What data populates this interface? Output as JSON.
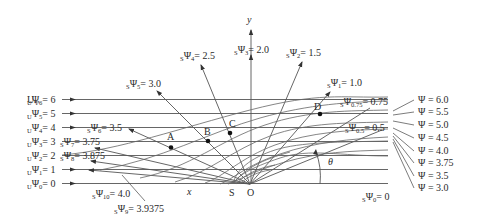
{
  "figure": {
    "axes": {
      "x_label": "x",
      "y_label": "y",
      "angle_label": "θ"
    },
    "points": {
      "S": "S",
      "O": "O",
      "A": "A",
      "B": "B",
      "C": "C",
      "D": "D"
    },
    "uniform_streamlines": [
      {
        "label": "UΨ6 = 6",
        "prefix": "U",
        "sub": "6",
        "value": "= 6"
      },
      {
        "label": "UΨ5 = 5",
        "prefix": "U",
        "sub": "5",
        "value": "= 5"
      },
      {
        "label": "UΨ4 = 4",
        "prefix": "U",
        "sub": "4",
        "value": "= 4"
      },
      {
        "label": "UΨ3 = 3",
        "prefix": "U",
        "sub": "3",
        "value": "= 3"
      },
      {
        "label": "UΨ2 = 2",
        "prefix": "U",
        "sub": "2",
        "value": "= 2"
      },
      {
        "label": "UΨ1 = 1",
        "prefix": "U",
        "sub": "1",
        "value": "= 1"
      },
      {
        "label": "UΨ0 = 0",
        "prefix": "U",
        "sub": "0",
        "value": "= 0"
      }
    ],
    "source_streamlines": [
      {
        "label": "SΨ0 = 0",
        "sub": "0",
        "value": "= 0"
      },
      {
        "label": "SΨ0.5 = 0.5",
        "sub": "0.5",
        "value": "= 0.5"
      },
      {
        "label": "SΨ0.75 = 0.75",
        "sub": "0.75",
        "value": "= 0.75"
      },
      {
        "label": "SΨ1 = 1.0",
        "sub": "1",
        "value": "= 1.0"
      },
      {
        "label": "SΨ2 = 1.5",
        "sub": "2",
        "value": "= 1.5"
      },
      {
        "label": "SΨ3 = 2.0",
        "sub": "3",
        "value": "= 2.0"
      },
      {
        "label": "SΨ4 = 2.5",
        "sub": "4",
        "value": "= 2.5"
      },
      {
        "label": "SΨ5 = 3.0",
        "sub": "5",
        "value": "= 3.0"
      },
      {
        "label": "SΨ6 = 3.5",
        "sub": "6",
        "value": "= 3.5"
      },
      {
        "label": "SΨ7 = 3.75",
        "sub": "7",
        "value": "= 3.75"
      },
      {
        "label": "SΨ8 = 3.875",
        "sub": "8",
        "value": "= 3.875"
      },
      {
        "label": "SΨ9 = 3.9375",
        "sub": "9",
        "value": "= 3.9375"
      },
      {
        "label": "SΨ10 = 4.0",
        "sub": "10",
        "value": "= 4.0"
      }
    ],
    "combined_streamlines": [
      "Ψ = 6.0",
      "Ψ = 5.5",
      "Ψ = 5.0",
      "Ψ = 4.5",
      "Ψ = 4.0",
      "Ψ = 3.75",
      "Ψ = 3.5",
      "Ψ = 3.0"
    ],
    "psi": "Ψ"
  }
}
